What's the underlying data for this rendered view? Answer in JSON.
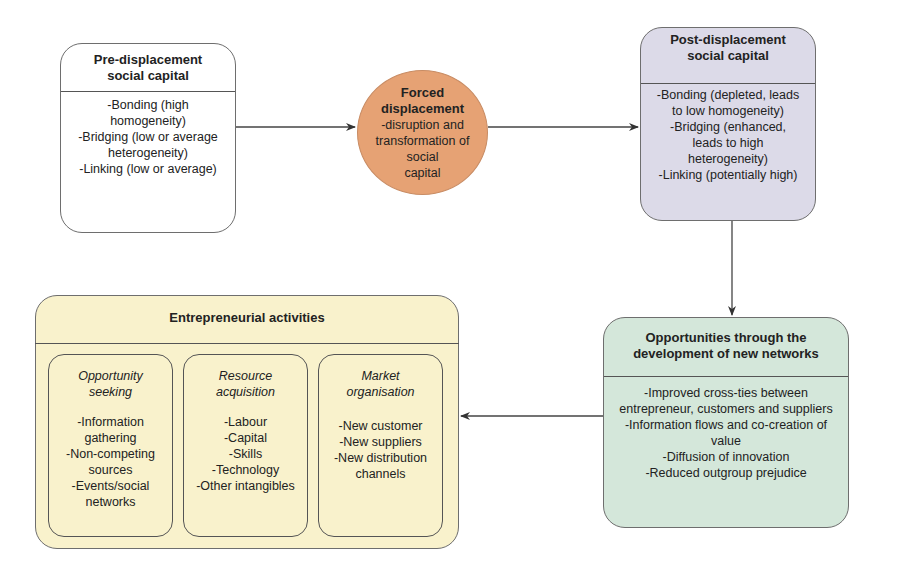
{
  "diagram": {
    "pre_displacement": {
      "title": "Pre-displacement social capital",
      "items": [
        "-Bonding (high homogeneity)",
        "-Bridging (low or average heterogeneity)",
        "-Linking (low or average)"
      ],
      "fill": "#ffffff"
    },
    "forced_displacement": {
      "title": "Forced displacement",
      "description": "-disruption and transformation of social capital",
      "fill": "#e6a274"
    },
    "post_displacement": {
      "title": "Post-displacement social capital",
      "items": [
        "-Bonding (depleted, leads to low homogeneity)",
        "-Bridging (enhanced, leads to high heterogeneity)",
        "-Linking (potentially high)"
      ],
      "fill": "#dcdae8"
    },
    "opportunities": {
      "title": "Opportunities through the development of new networks",
      "items": [
        "-Improved cross-ties between entrepreneur, customers and suppliers",
        "-Information flows and co-creation of value",
        "-Diffusion of innovation",
        "-Reduced outgroup prejudice"
      ],
      "fill": "#d4e7da"
    },
    "entrepreneurial_activities": {
      "title": "Entrepreneurial activities",
      "fill": "#f9f2cc",
      "groups": [
        {
          "title": "Opportunity seeking",
          "items": [
            "-Information gathering",
            "-Non-competing sources",
            "-Events/social networks"
          ]
        },
        {
          "title": "Resource acquisition",
          "items": [
            "-Labour",
            "-Capital",
            "-Skills",
            "-Technology",
            "-Other intangibles"
          ]
        },
        {
          "title": "Market organisation",
          "items": [
            "-New customer",
            "-New suppliers",
            "-New distribution channels"
          ]
        }
      ]
    },
    "edges": [
      {
        "from": "pre_displacement",
        "to": "forced_displacement"
      },
      {
        "from": "forced_displacement",
        "to": "post_displacement"
      },
      {
        "from": "post_displacement",
        "to": "opportunities"
      },
      {
        "from": "opportunities",
        "to": "entrepreneurial_activities"
      }
    ]
  },
  "display": {
    "pre_lines": [
      "-Bonding (high",
      "homogeneity)",
      "-Bridging (low or average",
      "heterogeneity)",
      "-Linking (low or average)"
    ],
    "pre_title_lines": [
      "Pre-displacement",
      "social capital"
    ],
    "post_title_lines": [
      "Post-displacement",
      "social capital"
    ],
    "post_lines": [
      "-Bonding (depleted, leads",
      "to low homogeneity)",
      "-Bridging (enhanced,",
      "leads to high",
      "heterogeneity)",
      "-Linking (potentially high)"
    ],
    "ellipse_desc_lines": [
      "-disruption and",
      "transformation of social",
      "capital"
    ],
    "opp_title_lines": [
      "Opportunities through the",
      "development of new networks"
    ],
    "opp_lines": [
      "-Improved cross-ties between",
      "entrepreneur, customers and suppliers",
      "-Information flows and co-creation of",
      "value",
      "-Diffusion of innovation",
      "-Reduced outgroup prejudice"
    ],
    "sub1_title_lines": [
      "Opportunity",
      "seeking"
    ],
    "sub1_lines": [
      "-Information",
      "gathering",
      "-Non-competing",
      "sources",
      "-Events/social",
      "networks"
    ],
    "sub2_title_lines": [
      "Resource",
      "acquisition"
    ],
    "sub2_lines": [
      "-Labour",
      "-Capital",
      "-Skills",
      "-Technology",
      "-Other intangibles"
    ],
    "sub3_title_lines": [
      "Market",
      "organisation"
    ],
    "sub3_lines": [
      "-New customer",
      "-New suppliers",
      "-New distribution",
      "channels"
    ]
  }
}
